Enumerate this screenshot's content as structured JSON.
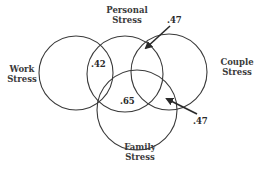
{
  "diagram": {
    "type": "venn",
    "sets": [
      {
        "id": "work",
        "label_line1": "Work",
        "label_line2": "Stress"
      },
      {
        "id": "personal",
        "label_line1": "Personal",
        "label_line2": "Stress"
      },
      {
        "id": "couple",
        "label_line1": "Couple",
        "label_line2": "Stress"
      },
      {
        "id": "family",
        "label_line1": "Family",
        "label_line2": "Stress"
      }
    ],
    "values": {
      "work_personal": ".42",
      "personal_couple": ".47",
      "personal_family": ".65",
      "couple_family": ".47"
    },
    "stroke_color": "#3a3a3a",
    "background": "#ffffff"
  }
}
